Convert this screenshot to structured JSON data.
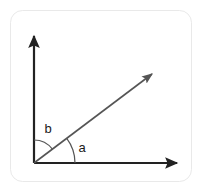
{
  "figure": {
    "background_color": "#ffffff",
    "frame": {
      "name": "rounded-frame",
      "x": 10,
      "y": 10,
      "width": 182,
      "height": 172,
      "radius": 12,
      "stroke_color": "#e9e9e9",
      "stroke_width": 1
    },
    "origin": {
      "x": 34,
      "y": 163
    },
    "axes": {
      "color": "#222222",
      "stroke_width": 2,
      "vertical": {
        "label": "vertical-axis",
        "from_x": 34,
        "from_y": 163,
        "to_x": 34,
        "to_y": 33,
        "arrowhead": "up"
      },
      "horizontal": {
        "label": "horizontal-axis",
        "from_x": 34,
        "from_y": 163,
        "to_x": 180,
        "to_y": 163,
        "arrowhead": "right"
      }
    },
    "ray": {
      "label": "diagonal-ray",
      "color": "#555555",
      "stroke_width": 1.6,
      "from_x": 34,
      "from_y": 163,
      "to_x": 156,
      "to_y": 71,
      "arrowhead": "up-right",
      "angle_from_horizontal_deg": 37
    },
    "arcs": [
      {
        "name": "angle-arc-a",
        "label": "a",
        "radius": 41,
        "start_deg": 0,
        "end_deg": 37,
        "color": "#555555",
        "stroke_width": 1.2
      },
      {
        "name": "angle-arc-b",
        "label": "b",
        "radius": 23,
        "start_deg": 37,
        "end_deg": 90,
        "color": "#555555",
        "stroke_width": 1.2
      }
    ],
    "labels": [
      {
        "name": "angle-label-a",
        "text": "a",
        "x": 82,
        "y": 152,
        "color": "#1a1a1a"
      },
      {
        "name": "angle-label-b",
        "text": "b",
        "x": 45,
        "y": 133,
        "color": "#1a1a1a"
      }
    ]
  }
}
